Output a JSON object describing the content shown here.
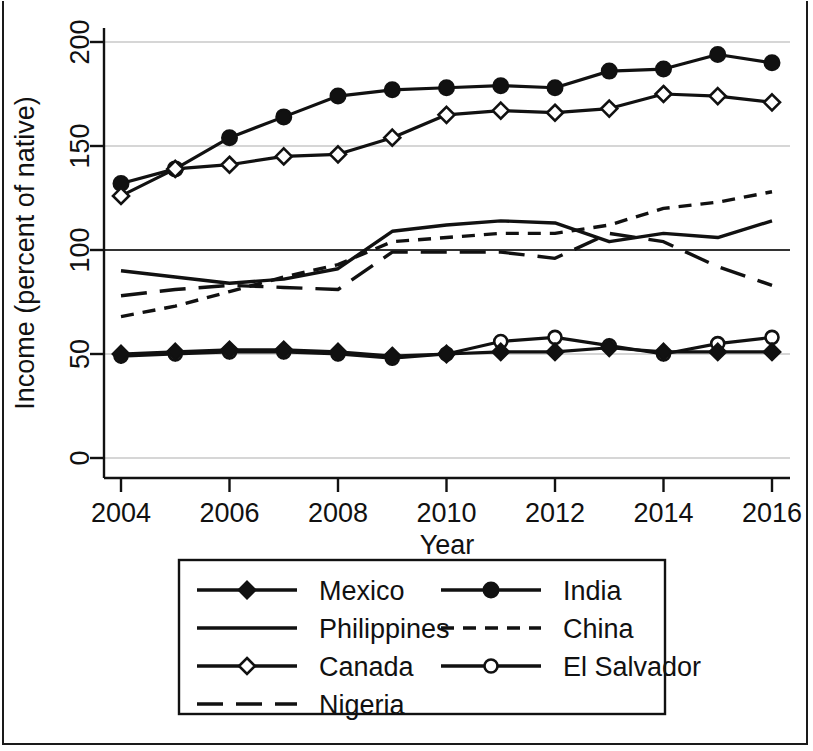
{
  "figure": {
    "background_color": "#ffffff",
    "line_color": "#111111",
    "gridline_color": "#c9c9c9",
    "reference_line_color": "#333333"
  },
  "axes": {
    "y_title": "Income (percent of native)",
    "x_title": "Year",
    "y_ticks": [
      "0",
      "50",
      "100",
      "150",
      "200"
    ],
    "x_ticks": [
      "2004",
      "2006",
      "2008",
      "2010",
      "2012",
      "2014",
      "2016"
    ]
  },
  "legend": {
    "entries": [
      {
        "label": "Mexico",
        "marker": "filled-diamond",
        "dash": "solid",
        "column": 1
      },
      {
        "label": "Philippines",
        "marker": "none",
        "dash": "solid",
        "column": 1
      },
      {
        "label": "Canada",
        "marker": "open-diamond",
        "dash": "solid",
        "column": 1
      },
      {
        "label": "Nigeria",
        "marker": "none",
        "dash": "long-dash",
        "column": 1
      },
      {
        "label": "India",
        "marker": "filled-circle",
        "dash": "solid",
        "column": 2
      },
      {
        "label": "China",
        "marker": "none",
        "dash": "short-dash",
        "column": 2
      },
      {
        "label": "El Salvador",
        "marker": "open-circle",
        "dash": "solid",
        "column": 2
      }
    ]
  },
  "chart_data": {
    "type": "line",
    "title": "",
    "xlabel": "Year",
    "ylabel": "Income (percent of native)",
    "x": [
      2004,
      2005,
      2006,
      2007,
      2008,
      2009,
      2010,
      2011,
      2012,
      2013,
      2014,
      2015,
      2016
    ],
    "xlim": [
      2003.5,
      2016.5
    ],
    "ylim": [
      0,
      210
    ],
    "y_ticks": [
      0,
      50,
      100,
      150,
      200
    ],
    "gridlines": [
      0,
      50,
      150,
      200
    ],
    "reference_line": 100,
    "grid": true,
    "legend_position": "below-plot",
    "series": [
      {
        "name": "India",
        "marker": "filled-circle",
        "dash": "solid",
        "values": [
          132,
          139,
          154,
          164,
          174,
          177,
          178,
          179,
          178,
          186,
          187,
          194,
          190
        ]
      },
      {
        "name": "Canada",
        "marker": "open-diamond",
        "dash": "solid",
        "values": [
          126,
          139,
          141,
          145,
          146,
          154,
          165,
          167,
          166,
          168,
          175,
          174,
          171
        ]
      },
      {
        "name": "Philippines",
        "marker": "none",
        "dash": "solid",
        "values": [
          90,
          87,
          84,
          86,
          91,
          109,
          112,
          114,
          113,
          104,
          108,
          106,
          114
        ]
      },
      {
        "name": "China",
        "marker": "none",
        "dash": "short-dash",
        "values": [
          68,
          73,
          80,
          87,
          93,
          104,
          106,
          108,
          108,
          112,
          120,
          123,
          128
        ]
      },
      {
        "name": "Nigeria",
        "marker": "none",
        "dash": "long-dash",
        "values": [
          78,
          81,
          83,
          82,
          81,
          99,
          99,
          99,
          96,
          108,
          104,
          92,
          83
        ]
      },
      {
        "name": "El Salvador",
        "marker": "open-circle",
        "dash": "solid",
        "values": [
          49,
          50,
          51,
          51,
          50,
          48,
          50,
          56,
          58,
          54,
          50,
          55,
          58
        ]
      },
      {
        "name": "Mexico",
        "marker": "filled-diamond",
        "dash": "solid",
        "values": [
          50,
          51,
          52,
          52,
          51,
          49,
          50,
          51,
          51,
          53,
          51,
          51,
          51
        ]
      }
    ]
  }
}
